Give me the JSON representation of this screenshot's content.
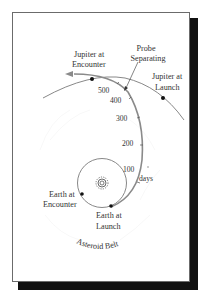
{
  "diagram": {
    "type": "orbital-trajectory",
    "labels": {
      "jupiter_encounter": [
        "Jupiter at",
        "Encounter"
      ],
      "probe_separating": [
        "Probe",
        "Separating"
      ],
      "jupiter_launch": [
        "Jupiter at",
        "Launch"
      ],
      "earth_encounter": [
        "Earth at",
        "Encounter"
      ],
      "earth_launch": [
        "Earth at",
        "Launch"
      ],
      "asteroid_belt": "Asteroid Belt",
      "days": "days"
    },
    "day_ticks": [
      {
        "value": "100"
      },
      {
        "value": "200"
      },
      {
        "value": "300"
      },
      {
        "value": "400"
      },
      {
        "value": "500"
      }
    ],
    "colors": {
      "trajectory": "#8a8a8a",
      "orbit": "#7a7a7a",
      "text": "#333333",
      "shadow": "#111111"
    }
  }
}
